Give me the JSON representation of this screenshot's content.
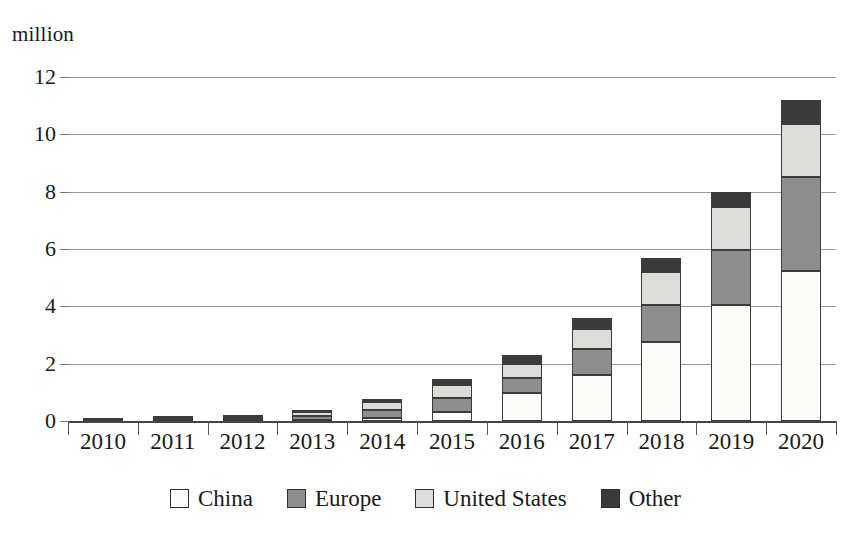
{
  "axis": {
    "unit_label": "million",
    "y_ticks": [
      "0",
      "2",
      "4",
      "6",
      "8",
      "10",
      "12"
    ],
    "x_ticks": [
      "2010",
      "2011",
      "2012",
      "2013",
      "2014",
      "2015",
      "2016",
      "2017",
      "2018",
      "2019",
      "2020"
    ]
  },
  "legend": {
    "items": [
      {
        "label": "China",
        "color": "#fbfbf8"
      },
      {
        "label": "Europe",
        "color": "#8e8e8e"
      },
      {
        "label": "United States",
        "color": "#dcdcd8"
      },
      {
        "label": "Other",
        "color": "#3a3a3a"
      }
    ]
  },
  "colors": {
    "china": "#fbfbf8",
    "europe": "#8e8e8e",
    "united_states": "#dcdcd8",
    "other": "#3a3a3a",
    "gridline": "#9a9a9a",
    "axis": "#444444",
    "bar_outline": "#3b3b3b",
    "text": "#1a1a1a"
  },
  "chart_data": {
    "type": "bar",
    "stacked": true,
    "title": "",
    "subtitle": "",
    "xlabel": "",
    "ylabel": "million",
    "ylim": [
      0,
      12
    ],
    "ytick_interval": 2,
    "grid": true,
    "legend_position": "bottom",
    "categories": [
      "2010",
      "2011",
      "2012",
      "2013",
      "2014",
      "2015",
      "2016",
      "2017",
      "2018",
      "2019",
      "2020"
    ],
    "series": [
      {
        "name": "China",
        "color": "#fbfbf8",
        "values": [
          0.0,
          0.01,
          0.02,
          0.04,
          0.11,
          0.31,
          0.98,
          1.6,
          2.75,
          4.05,
          5.25
        ]
      },
      {
        "name": "Europe",
        "color": "#8e8e8e",
        "values": [
          0.02,
          0.04,
          0.06,
          0.13,
          0.26,
          0.5,
          0.52,
          0.9,
          1.3,
          1.9,
          3.25
        ]
      },
      {
        "name": "United States",
        "color": "#dcdcd8",
        "values": [
          0.02,
          0.04,
          0.07,
          0.16,
          0.29,
          0.45,
          0.5,
          0.7,
          1.15,
          1.5,
          1.85
        ]
      },
      {
        "name": "Other",
        "color": "#3a3a3a",
        "values": [
          0.01,
          0.04,
          0.04,
          0.07,
          0.1,
          0.19,
          0.3,
          0.4,
          0.5,
          0.55,
          0.85
        ]
      }
    ],
    "totals": [
      0.05,
      0.13,
      0.19,
      0.4,
      0.76,
      1.45,
      2.3,
      3.6,
      5.7,
      8.0,
      11.2
    ]
  }
}
